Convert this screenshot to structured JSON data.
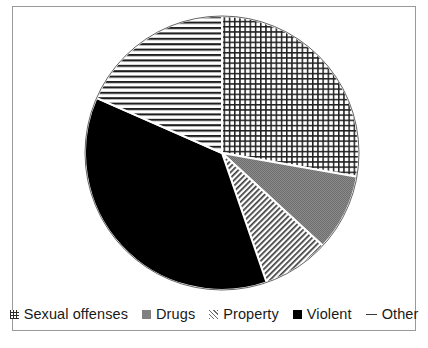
{
  "figure": {
    "title": "",
    "background": "#ffffff",
    "border_color": "#9a9a9a"
  },
  "legend": {
    "position": "bottom",
    "entries": [
      {
        "label": "Sexual offenses",
        "marker": "grid-swatch-icon",
        "pattern": "crosshatch-grid",
        "color": "#2b2b2b"
      },
      {
        "label": "Drugs",
        "marker": "solid-gray-swatch-icon",
        "pattern": "solid-gray",
        "color": "#808080"
      },
      {
        "label": "Property",
        "marker": "diagonal-hatch-swatch-icon",
        "pattern": "diagonal-hatch",
        "color": "#6e6e6e"
      },
      {
        "label": "Violent",
        "marker": "solid-black-swatch-icon",
        "pattern": "solid-black",
        "color": "#000000"
      },
      {
        "label": "Other",
        "marker": "dash-line-swatch-icon",
        "pattern": "horizontal-lines",
        "color": "#3a3a3a"
      }
    ]
  },
  "chart_data": {
    "type": "pie",
    "title": "",
    "xlabel": "",
    "ylabel": "",
    "start_angle_deg": 0,
    "direction": "clockwise",
    "center": {
      "x": 222,
      "y": 153
    },
    "radius": 137,
    "legend_position": "bottom",
    "grid": false,
    "categories": [
      "Sexual offenses",
      "Drugs",
      "Property",
      "Violent",
      "Other"
    ],
    "values": [
      27.8,
      9.1,
      7.9,
      36.9,
      18.4
    ],
    "angles_deg": [
      100.0,
      32.6,
      28.4,
      132.7,
      66.3
    ],
    "units": "percent",
    "slices": [
      {
        "label": "Sexual offenses",
        "percent": 27.8,
        "angle_deg": 100.0,
        "start_deg": 0.0,
        "end_deg": 100.0,
        "pattern": "crosshatch-grid",
        "color": "#2b2b2b"
      },
      {
        "label": "Drugs",
        "percent": 9.1,
        "angle_deg": 32.6,
        "start_deg": 100.0,
        "end_deg": 132.6,
        "pattern": "solid-gray",
        "color": "#808080"
      },
      {
        "label": "Property",
        "percent": 7.9,
        "angle_deg": 28.4,
        "start_deg": 132.6,
        "end_deg": 161.0,
        "pattern": "diagonal-hatch",
        "color": "#6e6e6e"
      },
      {
        "label": "Violent",
        "percent": 36.9,
        "angle_deg": 132.7,
        "start_deg": 161.0,
        "end_deg": 293.7,
        "pattern": "solid-black",
        "color": "#000000"
      },
      {
        "label": "Other",
        "percent": 18.4,
        "angle_deg": 66.3,
        "start_deg": 293.7,
        "end_deg": 360.0,
        "pattern": "horizontal-lines",
        "color": "#3a3a3a"
      }
    ]
  }
}
